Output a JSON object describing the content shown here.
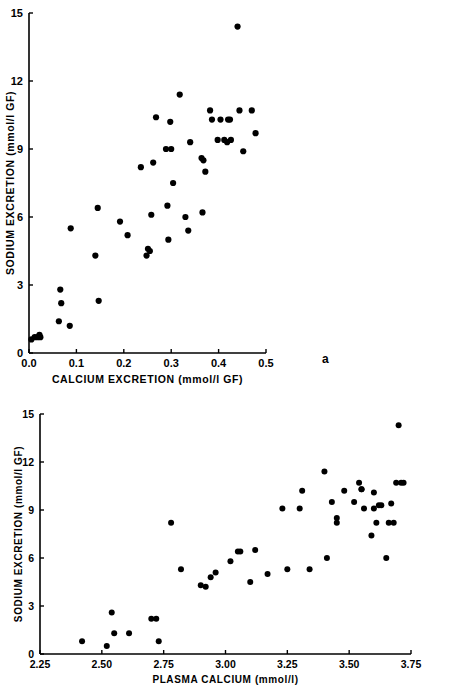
{
  "figure": {
    "panel_a_letter": "a",
    "panel_b_letter": "b"
  },
  "chart_data": [
    {
      "type": "scatter",
      "panel": "a",
      "title": "",
      "xlabel": "CALCIUM EXCRETION (mmol/l GF)",
      "ylabel": "SODIUM EXCRETION (mmol/l GF)",
      "xlim": [
        0.0,
        0.5
      ],
      "ylim": [
        0,
        15
      ],
      "xticks": [
        0.0,
        0.1,
        0.2,
        0.3,
        0.4,
        0.5
      ],
      "xticklabels": [
        "0.0",
        "0.1",
        "0.2",
        "0.3",
        "0.4",
        "0.5"
      ],
      "yticks": [
        0,
        3,
        6,
        9,
        12,
        15
      ],
      "yticklabels": [
        "0",
        "3",
        "6",
        "9",
        "12",
        "15"
      ],
      "grid": false,
      "legend": "none",
      "marker": "filled-circle",
      "marker_color": "#000000",
      "x": [
        0.005,
        0.012,
        0.018,
        0.022,
        0.024,
        0.063,
        0.066,
        0.068,
        0.086,
        0.088,
        0.14,
        0.145,
        0.147,
        0.192,
        0.208,
        0.236,
        0.248,
        0.251,
        0.255,
        0.258,
        0.262,
        0.268,
        0.289,
        0.292,
        0.294,
        0.298,
        0.3,
        0.304,
        0.318,
        0.33,
        0.336,
        0.34,
        0.364,
        0.366,
        0.368,
        0.372,
        0.382,
        0.386,
        0.398,
        0.404,
        0.412,
        0.418,
        0.42,
        0.424,
        0.426,
        0.44,
        0.444,
        0.452,
        0.47,
        0.478
      ],
      "y": [
        0.6,
        0.7,
        0.7,
        0.8,
        0.7,
        1.4,
        2.8,
        2.2,
        1.2,
        5.5,
        4.3,
        6.4,
        2.3,
        5.8,
        5.2,
        8.2,
        4.3,
        4.6,
        4.5,
        6.1,
        8.4,
        10.4,
        9.0,
        6.5,
        5.0,
        10.2,
        9.0,
        7.5,
        11.4,
        6.0,
        5.4,
        9.3,
        8.6,
        6.2,
        8.5,
        8.0,
        10.7,
        10.3,
        9.4,
        10.3,
        9.4,
        9.3,
        10.3,
        10.3,
        9.4,
        14.4,
        10.7,
        8.9,
        10.7,
        9.7
      ]
    },
    {
      "type": "scatter",
      "panel": "b",
      "title": "",
      "xlabel": "PLASMA CALCIUM (mmol/l)",
      "ylabel": "SODIUM EXCRETION (mmol/l GF)",
      "xlim": [
        2.25,
        3.75
      ],
      "ylim": [
        0,
        15
      ],
      "xticks": [
        2.25,
        2.5,
        2.75,
        3.0,
        3.25,
        3.5,
        3.75
      ],
      "xticklabels": [
        "2.25",
        "2.50",
        "2.75",
        "3.00",
        "3.25",
        "3.50",
        "3.75"
      ],
      "yticks": [
        0,
        3,
        6,
        9,
        12,
        15
      ],
      "yticklabels": [
        "0",
        "3",
        "6",
        "9",
        "12",
        "15"
      ],
      "grid": false,
      "legend": "none",
      "marker": "filled-circle",
      "marker_color": "#000000",
      "x": [
        2.42,
        2.52,
        2.54,
        2.55,
        2.61,
        2.7,
        2.72,
        2.73,
        2.78,
        2.82,
        2.9,
        2.92,
        2.94,
        2.96,
        3.02,
        3.05,
        3.1,
        3.12,
        3.17,
        3.23,
        3.25,
        3.3,
        3.31,
        3.4,
        3.41,
        3.43,
        3.45,
        3.45,
        3.48,
        3.54,
        3.55,
        3.55,
        3.56,
        3.59,
        3.6,
        3.6,
        3.61,
        3.62,
        3.65,
        3.66,
        3.67,
        3.69,
        3.7,
        3.71,
        3.06,
        3.34,
        3.52,
        3.63,
        3.68,
        3.72
      ],
      "y": [
        0.8,
        0.5,
        2.6,
        1.3,
        1.3,
        2.2,
        2.2,
        0.8,
        8.2,
        5.3,
        4.3,
        4.2,
        4.8,
        5.1,
        5.8,
        6.4,
        4.5,
        6.5,
        5.0,
        9.1,
        5.3,
        9.1,
        10.2,
        11.4,
        6.0,
        9.5,
        8.5,
        8.2,
        10.2,
        10.7,
        10.3,
        10.3,
        9.1,
        7.4,
        10.1,
        9.1,
        8.2,
        9.3,
        6.0,
        8.2,
        9.4,
        10.7,
        14.3,
        10.7,
        6.4,
        5.3,
        9.5,
        9.3,
        8.2,
        10.7
      ]
    }
  ]
}
